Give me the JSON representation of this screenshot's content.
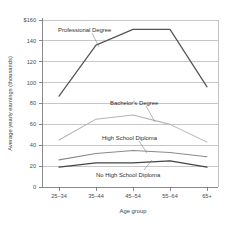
{
  "chart_data": {
    "type": "line",
    "title": "",
    "xlabel": "Age group",
    "ylabel": "Average yearly earnings (thousands)",
    "categories": [
      "25–34",
      "35–44",
      "45–54",
      "55–64",
      "65+"
    ],
    "ylim": [
      0,
      160
    ],
    "yticks": [
      0,
      20,
      40,
      60,
      80,
      100,
      120,
      140,
      160
    ],
    "ytick_labels": [
      "0",
      "20",
      "40",
      "60",
      "80",
      "100",
      "120",
      "140",
      "$160"
    ],
    "grid": "horizontal",
    "legend": "inline-annotations",
    "series": [
      {
        "name": "Professional Degree",
        "values": [
          87,
          136,
          151,
          151,
          96
        ],
        "color": "#555555",
        "width": 1.25
      },
      {
        "name": "Bachelor's Degree",
        "values": [
          45,
          65,
          69,
          60,
          43
        ],
        "color": "#b4b4b4",
        "width": 1.05
      },
      {
        "name": "High School Diploma",
        "values": [
          26,
          32,
          35,
          33,
          29
        ],
        "color": "#8a8a8a",
        "width": 1.05
      },
      {
        "name": "No High School Diploma",
        "values": [
          19,
          23,
          23,
          25,
          19
        ],
        "color": "#444444",
        "width": 1.25
      }
    ],
    "annotations": [
      {
        "text": "Professional Degree",
        "for": "Professional Degree"
      },
      {
        "text": "Bachelor's Degree",
        "for": "Bachelor's Degree"
      },
      {
        "text": "High School Diploma",
        "for": "High School Diploma"
      },
      {
        "text": "No High School Diploma",
        "for": "No High School Diploma"
      }
    ]
  },
  "axes": {
    "y_title": "Average yearly earnings (thousands)",
    "x_title": "Age group",
    "y_labels": {
      "t160": "$160",
      "t140": "140",
      "t120": "120",
      "t100": "100",
      "t80": "80",
      "t60": "60",
      "t40": "40",
      "t20": "20",
      "t0": "0"
    },
    "x_labels": {
      "c0": "25–34",
      "c1": "35–44",
      "c2": "45–54",
      "c3": "55–64",
      "c4": "65+"
    }
  },
  "labels": {
    "professional": "Professional Degree",
    "bachelors": "Bachelor's Degree",
    "highschool": "High School Diploma",
    "nohighschool": "No High School Diploma"
  },
  "colors": {
    "professional": "#555555",
    "bachelors": "#b4b4b4",
    "highschool": "#8a8a8a",
    "nohighschool": "#444444",
    "grid": "#8f8f8f",
    "axis": "#5a5a5a",
    "background": "#ffffff"
  }
}
